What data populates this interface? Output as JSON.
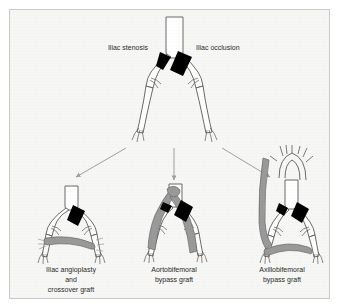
{
  "figure": {
    "panel_background": "#f7f7f5",
    "panel_border_color": "#c9c9c7",
    "vessel_outline_color": "#5a5a5a",
    "vessel_fill_color": "#ffffff",
    "lesion_color": "#000000",
    "graft_color": "#9a9a9a",
    "graft_outline_color": "#6a6a6a",
    "arrow_color": "#a0a0a0",
    "text_color": "#2b2b2b"
  },
  "top_diagram": {
    "name": "aortoiliac-disease-overview",
    "labels": {
      "left": "Iliac stenosis",
      "right": "Iliac occlusion"
    }
  },
  "arrows": [
    {
      "name": "arrow-to-left-option",
      "direction": "down-left"
    },
    {
      "name": "arrow-to-middle-option",
      "direction": "down"
    },
    {
      "name": "arrow-to-right-option",
      "direction": "down-right"
    }
  ],
  "options": [
    {
      "id": "iliac-angioplasty-crossover",
      "caption_lines": [
        "Iliac angioplasty",
        "and",
        "crossover graft"
      ]
    },
    {
      "id": "aortobifemoral-bypass",
      "caption_lines": [
        "Aortobifemoral",
        "bypass graft"
      ]
    },
    {
      "id": "axillobifemoral-bypass",
      "caption_lines": [
        "Axillobifemoral",
        "bypass graft"
      ]
    }
  ]
}
